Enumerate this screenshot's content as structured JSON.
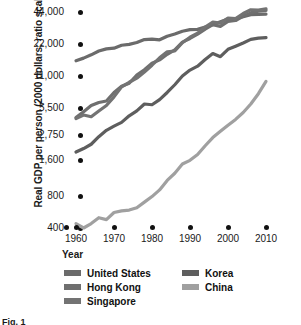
{
  "axes": {
    "ylabel": "Real GDP per person (2000 dollars; ratio scale)",
    "xlabel": "Year"
  },
  "caption": "Fig. 1",
  "colors": {
    "united_states": "#6b6b6b",
    "hong_kong": "#6f6f6f",
    "singapore": "#737373",
    "korea": "#5e5e5e",
    "china": "#a0a0a0",
    "tick": "#111111",
    "text": "#1a1a1a",
    "background": "#ffffff"
  },
  "chart_data": {
    "type": "line",
    "title": "",
    "subtitle": "",
    "xlabel": "Year",
    "ylabel": "Real GDP per person (2000 dollars; ratio scale)",
    "yscale": "log",
    "ratio_scale": true,
    "grid": false,
    "legend_position": "bottom",
    "xlim": [
      1957,
      2011
    ],
    "ylim": [
      400,
      52000
    ],
    "xticks": [
      1960,
      1970,
      1980,
      1990,
      2000,
      2010
    ],
    "xticklabels": [
      "1960",
      "1970",
      "1980",
      "1990",
      "2000",
      "2010"
    ],
    "yticks": [
      400,
      800,
      1600,
      2750,
      5500,
      11000,
      22000,
      44000
    ],
    "yticklabels": [
      "400",
      "800",
      "1,600",
      "2,750",
      "5,500",
      "11,000",
      "22,000",
      "44,000"
    ],
    "x": [
      1960,
      1962,
      1964,
      1966,
      1968,
      1970,
      1972,
      1974,
      1976,
      1978,
      1980,
      1982,
      1984,
      1986,
      1988,
      1990,
      1992,
      1994,
      1996,
      1998,
      2000,
      2002,
      2004,
      2006,
      2008,
      2010
    ],
    "series": [
      {
        "name": "United States",
        "color": "#6b6b6b",
        "values": [
          15300,
          16200,
          17400,
          18900,
          19800,
          20100,
          21400,
          21800,
          22700,
          24200,
          24400,
          24100,
          26000,
          27300,
          29000,
          30000,
          30200,
          31800,
          33400,
          35700,
          37700,
          38000,
          39800,
          41600,
          41800,
          42000
        ]
      },
      {
        "name": "Hong Kong",
        "color": "#6f6f6f",
        "values": [
          4300,
          5000,
          5800,
          6200,
          6400,
          7700,
          8800,
          9400,
          11200,
          12600,
          14500,
          15600,
          17600,
          19400,
          22900,
          24800,
          27200,
          30400,
          33400,
          32200,
          35900,
          36600,
          40200,
          43200,
          44800,
          45600
        ]
      },
      {
        "name": "Singapore",
        "color": "#737373",
        "values": [
          4200,
          4600,
          4400,
          5100,
          5800,
          7000,
          8700,
          9600,
          10500,
          12000,
          13900,
          16300,
          18600,
          18900,
          22600,
          25500,
          27800,
          31800,
          35400,
          34600,
          38600,
          38200,
          42600,
          46200,
          45800,
          47200
        ]
      },
      {
        "name": "Korea",
        "color": "#5e5e5e",
        "values": [
          1900,
          2050,
          2250,
          2650,
          3100,
          3450,
          3800,
          4500,
          5100,
          6000,
          5900,
          6600,
          7700,
          9100,
          11000,
          12500,
          13600,
          15700,
          17900,
          16700,
          19600,
          21000,
          22500,
          24300,
          25000,
          25300
        ]
      },
      {
        "name": "China",
        "color": "#a0a0a0",
        "values": [
          440,
          400,
          440,
          500,
          480,
          560,
          580,
          590,
          620,
          700,
          790,
          900,
          1080,
          1240,
          1480,
          1590,
          1800,
          2180,
          2600,
          3020,
          3530,
          4100,
          4900,
          6000,
          7500,
          9800
        ]
      }
    ]
  },
  "legend": {
    "left_column": [
      {
        "label": "United States",
        "color": "#6b6b6b"
      },
      {
        "label": "Hong Kong",
        "color": "#6f6f6f"
      },
      {
        "label": "Singapore",
        "color": "#737373"
      }
    ],
    "right_column": [
      {
        "label": "Korea",
        "color": "#5e5e5e"
      },
      {
        "label": "China",
        "color": "#a0a0a0"
      }
    ]
  }
}
